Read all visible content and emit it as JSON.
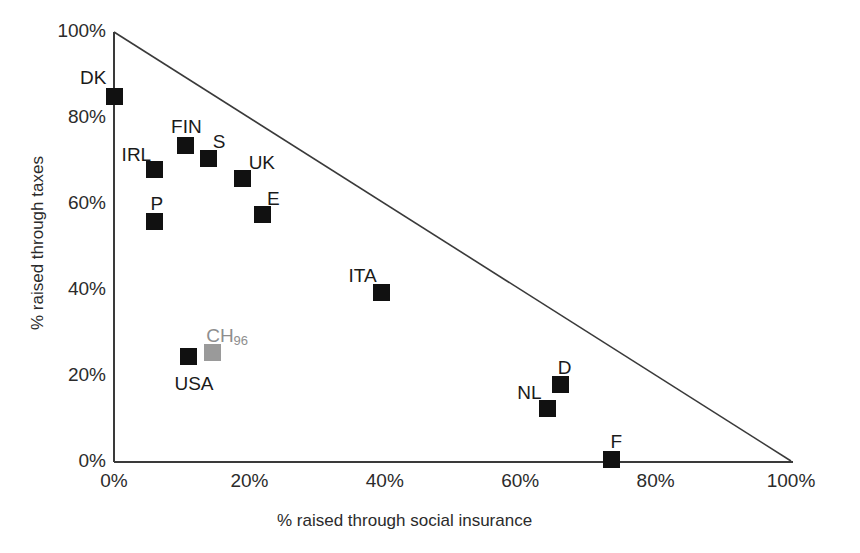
{
  "chart_data": {
    "type": "scatter",
    "title": "",
    "xlabel": "% raised through social insurance",
    "ylabel": "% raised through taxes",
    "xlim": [
      0,
      100
    ],
    "ylim": [
      0,
      100
    ],
    "grid": false,
    "legend": "none",
    "xticks": [
      "0%",
      "20%",
      "40%",
      "60%",
      "80%",
      "100%"
    ],
    "xtick_values": [
      0,
      20,
      40,
      60,
      80,
      100
    ],
    "yticks": [
      "0%",
      "20%",
      "40%",
      "60%",
      "80%",
      "100%"
    ],
    "ytick_values": [
      0,
      20,
      40,
      60,
      80,
      100
    ],
    "annotations": [
      "Constraint line from (0%,100%) to (100%,0%): taxes + social insurance = 100%"
    ],
    "points": [
      {
        "label": "DK",
        "x": 0.0,
        "y": 85.0,
        "color": "#111111",
        "label_dx": -34,
        "label_dy": -30
      },
      {
        "label": "FIN",
        "x": 10.5,
        "y": 73.5,
        "color": "#111111",
        "label_dx": -14,
        "label_dy": -30
      },
      {
        "label": "S",
        "x": 14.0,
        "y": 70.5,
        "color": "#111111",
        "label_dx": 4,
        "label_dy": -28
      },
      {
        "label": "IRL",
        "x": 6.0,
        "y": 68.0,
        "color": "#111111",
        "label_dx": -33,
        "label_dy": -26
      },
      {
        "label": "UK",
        "x": 19.0,
        "y": 66.0,
        "color": "#111111",
        "label_dx": 6,
        "label_dy": -26
      },
      {
        "label": "E",
        "x": 22.0,
        "y": 57.5,
        "color": "#111111",
        "label_dx": 4,
        "label_dy": -27
      },
      {
        "label": "P",
        "x": 6.0,
        "y": 56.0,
        "color": "#111111",
        "label_dx": -4,
        "label_dy": -28
      },
      {
        "label": "ITA",
        "x": 39.5,
        "y": 39.5,
        "color": "#111111",
        "label_dx": -33,
        "label_dy": -27
      },
      {
        "label": "CH",
        "sub": "96",
        "x": 14.5,
        "y": 25.5,
        "color": "#9a9a9a",
        "label_dx": -6,
        "label_dy": -27
      },
      {
        "label": "USA",
        "x": 11.0,
        "y": 24.5,
        "color": "#111111",
        "label_dx": -14,
        "label_dy": 16
      },
      {
        "label": "D",
        "x": 66.0,
        "y": 18.0,
        "color": "#111111",
        "label_dx": -3,
        "label_dy": -28
      },
      {
        "label": "NL",
        "x": 64.0,
        "y": 12.5,
        "color": "#111111",
        "label_dx": -30,
        "label_dy": -26
      },
      {
        "label": "F",
        "x": 73.5,
        "y": 0.5,
        "color": "#111111",
        "label_dx": -1,
        "label_dy": -29
      }
    ]
  },
  "axes": {
    "x_title": "% raised through social insurance",
    "y_title": "% raised through taxes"
  },
  "colors": {
    "marker": "#111111",
    "marker_highlight": "#9a9a9a",
    "axis": "#3a3a3a",
    "background": "#ffffff"
  }
}
